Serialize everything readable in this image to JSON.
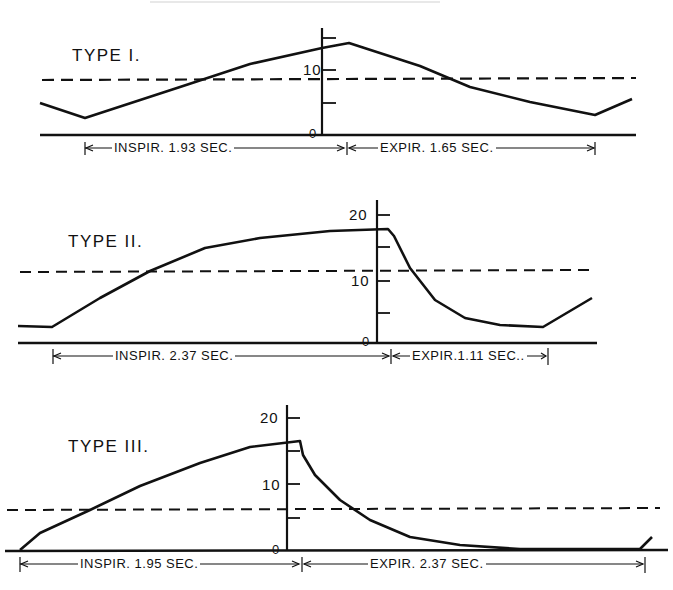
{
  "chart_data": [
    {
      "type": "line",
      "title": "TYPE I.",
      "ylabel": "",
      "xlabel": "",
      "y_ticks": [
        0,
        5,
        10,
        15
      ],
      "y_tick_labels": [
        "0",
        "10"
      ],
      "threshold_dashed": 8.8,
      "phases": [
        {
          "label": "INSPIR. 1.93 SEC.",
          "duration_sec": 1.93
        },
        {
          "label": "EXPIR. 1.65 SEC.",
          "duration_sec": 1.65
        }
      ],
      "description": "Linear rise during inspiration to peak (~14) then linear fall during expiration",
      "points_px": [
        [
          40,
          103
        ],
        [
          85,
          118
        ],
        [
          180,
          87
        ],
        [
          250,
          64
        ],
        [
          322,
          48
        ],
        [
          349,
          43
        ],
        [
          420,
          66
        ],
        [
          470,
          87
        ],
        [
          530,
          102
        ],
        [
          595,
          115
        ],
        [
          632,
          99
        ]
      ],
      "approx_values": [
        {
          "t": "start",
          "y": 5
        },
        {
          "t": "end-expir / start-inspir",
          "y": 2.7
        },
        {
          "t": "end-inspir",
          "y": 14
        },
        {
          "t": "end-expir",
          "y": 3
        }
      ]
    },
    {
      "type": "line",
      "title": "TYPE II.",
      "y_ticks": [
        0,
        5,
        10,
        15,
        20
      ],
      "y_tick_labels": [
        "0",
        "10",
        "20"
      ],
      "threshold_dashed": 11.6,
      "phases": [
        {
          "label": "INSPIR. 2.37 SEC.",
          "duration_sec": 2.37
        },
        {
          "label": "EXPIR. 1.11 SEC.",
          "duration_sec": 1.11
        }
      ],
      "description": "Rise with decelerating slope to plateau (~17.8) then rapid exponential-like fall",
      "points_px": [
        [
          18,
          326
        ],
        [
          52,
          327
        ],
        [
          100,
          298
        ],
        [
          150,
          271
        ],
        [
          205,
          248
        ],
        [
          260,
          238
        ],
        [
          330,
          231
        ],
        [
          388,
          229
        ],
        [
          394,
          236
        ],
        [
          410,
          268
        ],
        [
          435,
          300
        ],
        [
          465,
          318
        ],
        [
          500,
          325
        ],
        [
          543,
          327
        ],
        [
          592,
          298
        ]
      ],
      "approx_values": [
        {
          "t": "start",
          "y": 2.6
        },
        {
          "t": "end-inspir (plateau)",
          "y": 17.8
        },
        {
          "t": "end-expir",
          "y": 2.4
        }
      ]
    },
    {
      "type": "line",
      "title": "TYPE III.",
      "y_ticks": [
        0,
        5,
        10,
        15,
        20
      ],
      "y_tick_labels": [
        "0",
        "10",
        "20"
      ],
      "threshold_dashed": 6.4,
      "phases": [
        {
          "label": "INSPIR. 1.95 SEC.",
          "duration_sec": 1.95
        },
        {
          "label": "EXPIR. 2.37 SEC.",
          "duration_sec": 2.37
        }
      ],
      "description": "Rise from zero to peak (~16.5) then sharp drop followed by exponential decay to zero",
      "points_px": [
        [
          20,
          550
        ],
        [
          40,
          533
        ],
        [
          90,
          510
        ],
        [
          140,
          486
        ],
        [
          200,
          463
        ],
        [
          250,
          447
        ],
        [
          300,
          441
        ],
        [
          303,
          455
        ],
        [
          315,
          475
        ],
        [
          340,
          500
        ],
        [
          370,
          520
        ],
        [
          410,
          537
        ],
        [
          460,
          545
        ],
        [
          520,
          549
        ],
        [
          640,
          549
        ],
        [
          652,
          537
        ]
      ],
      "approx_values": [
        {
          "t": "start",
          "y": 0
        },
        {
          "t": "end-inspir (peak)",
          "y": 16.5
        },
        {
          "t": "end-expir",
          "y": 0
        }
      ]
    }
  ],
  "panels": [
    {
      "title": "TYPE I.",
      "tick_10": "10",
      "tick_0": "0",
      "inspir_label": "INSPIR. 1.93 SEC.",
      "expir_label": "EXPIR. 1.65 SEC."
    },
    {
      "title": "TYPE II.",
      "tick_20": "20",
      "tick_10": "10",
      "tick_0": "0",
      "inspir_label": "INSPIR. 2.37 SEC.",
      "expir_label": "EXPIR.1.11 SEC.."
    },
    {
      "title": "TYPE III.",
      "tick_20": "20",
      "tick_10": "10",
      "tick_0": "0",
      "inspir_label": "INSPIR. 1.95 SEC.",
      "expir_label": "EXPIR. 2.37 SEC."
    }
  ],
  "colors": {
    "ink": "#111111",
    "background": "#ffffff"
  }
}
